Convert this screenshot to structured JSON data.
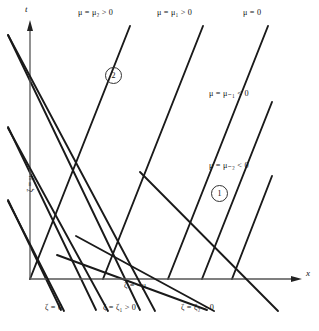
{
  "figure": {
    "axes": {
      "x_axis_label": "x",
      "t_axis_label": "t",
      "origin_x": 30,
      "origin_y": 279,
      "x_axis_end": 300,
      "t_axis_top": 22
    },
    "line_color": "#1a1a1a",
    "axis_color": "#555555",
    "background": "#ffffff"
  },
  "labels": {
    "top": [
      {
        "id": "mu-2-pos",
        "text": "μ = μ₂ > 0",
        "x": 78,
        "y": 13
      },
      {
        "id": "mu-1-pos",
        "text": "μ = μ₁ > 0",
        "x": 157,
        "y": 13
      },
      {
        "id": "mu-0",
        "text": "μ = 0",
        "x": 240,
        "y": 13
      }
    ],
    "right": [
      {
        "id": "mu-neg1",
        "text": "μ = μ₋₁ < 0",
        "x": 208,
        "y": 93
      },
      {
        "id": "mu-neg2",
        "text": "μ = μ₋₂ < 0",
        "x": 208,
        "y": 165
      }
    ],
    "bottom": [
      {
        "id": "zeta-0",
        "text": "ζ = 0",
        "x": 44,
        "y": 309
      },
      {
        "id": "zeta-1",
        "text": "ζ = ζ₁ > 0",
        "x": 103,
        "y": 309
      },
      {
        "id": "zeta-2",
        "text": "ζ = ζ₂ > 0",
        "x": 180,
        "y": 309
      }
    ],
    "interior": [
      {
        "id": "zeta-eq-neg-mu",
        "text": "ζ = −μ",
        "x": 123,
        "y": 285
      }
    ],
    "rotated": [
      {
        "id": "zeta-eq-mu",
        "text": "ζ = μ",
        "x": 25,
        "y": 185
      }
    ]
  },
  "regions": [
    {
      "id": "region-2",
      "text": "2",
      "x": 105,
      "y": 68
    },
    {
      "id": "region-1",
      "text": "1",
      "x": 211,
      "y": 186
    }
  ],
  "characteristics": {
    "mu_family_note": "up-right characteristics (slope +1 in x-t plane)",
    "zeta_family_note": "down-right characteristics (slope -1 in x-t plane)",
    "mu_lines": [
      {
        "id": "mu-2",
        "label": "μ = μ₂ > 0",
        "x1": 30,
        "y1": 279,
        "x2": 128,
        "y2": 28
      },
      {
        "id": "mu-1",
        "label": "μ = μ₁ > 0",
        "x1": 103,
        "y1": 279,
        "x2": 200,
        "y2": 28
      },
      {
        "id": "mu-0",
        "label": "μ = 0",
        "x1": 175,
        "y1": 279,
        "x2": 268,
        "y2": 28
      },
      {
        "id": "mu-neg1",
        "label": "μ = μ₋₁ < 0",
        "x1": 178,
        "y1": 279,
        "x2": 272,
        "y2": 104
      },
      {
        "id": "mu-neg2",
        "label": "μ = μ₋₂ < 0",
        "x1": 213,
        "y1": 279,
        "x2": 272,
        "y2": 176
      }
    ],
    "zeta_lines": [
      {
        "id": "zeta-0",
        "label": "ζ = 0",
        "x1": 8,
        "y1": 35,
        "x2": 60,
        "y2": 310
      },
      {
        "id": "zeta-1",
        "label": "ζ = ζ₁ > 0",
        "x1": 8,
        "y1": 125,
        "x2": 135,
        "y2": 310
      },
      {
        "id": "zeta-2",
        "label": "ζ = ζ₂ > 0",
        "x1": 8,
        "y1": 200,
        "x2": 210,
        "y2": 310
      },
      {
        "id": "zeta-3",
        "label": "",
        "x1": 30,
        "y1": 279,
        "x2": 278,
        "y2": 310
      }
    ]
  }
}
